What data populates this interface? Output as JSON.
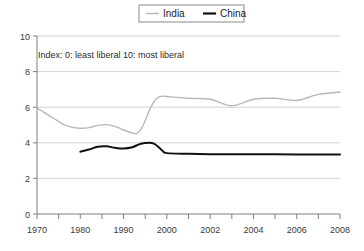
{
  "chart_data": {
    "type": "line",
    "title": "",
    "subtitle": "",
    "annotation": "Index: 0: least liberal 10: most liberal",
    "xlabel": "",
    "ylabel": "",
    "ylim": [
      0,
      10
    ],
    "yticks": [
      0,
      2,
      4,
      6,
      8,
      10
    ],
    "ytick_labels": [
      "0",
      "2",
      "4",
      "6",
      "8",
      "10"
    ],
    "grid": true,
    "grid_axis": "y",
    "xtick_labels": [
      "1970",
      "1980",
      "1990",
      "2000",
      "2002",
      "2004",
      "2006",
      "2008"
    ],
    "xtick_values": [
      1970,
      1980,
      1990,
      2000,
      2002,
      2004,
      2006,
      2008
    ],
    "x_axis_note": "non-linear: decade spacing 1970-2000, biennial 2000-2008",
    "legend": {
      "position": "top-center",
      "entries": [
        {
          "name": "India",
          "color": "#b9b9b9"
        },
        {
          "name": "China",
          "color": "#111111"
        }
      ]
    },
    "series": [
      {
        "name": "India",
        "color": "#b9b9b9",
        "width": 1.4,
        "points": [
          [
            1970,
            5.95
          ],
          [
            1972,
            5.65
          ],
          [
            1974,
            5.35
          ],
          [
            1976,
            5.05
          ],
          [
            1978,
            4.88
          ],
          [
            1980,
            4.82
          ],
          [
            1982,
            4.85
          ],
          [
            1984,
            4.98
          ],
          [
            1986,
            5.02
          ],
          [
            1988,
            4.92
          ],
          [
            1990,
            4.72
          ],
          [
            1992,
            4.55
          ],
          [
            1993,
            4.52
          ],
          [
            1994,
            4.75
          ],
          [
            1995,
            5.25
          ],
          [
            1996,
            5.85
          ],
          [
            1997,
            6.3
          ],
          [
            1998,
            6.55
          ],
          [
            1999,
            6.62
          ],
          [
            2000,
            6.6
          ],
          [
            2001,
            6.5
          ],
          [
            2002,
            6.45
          ],
          [
            2003,
            6.08
          ],
          [
            2004,
            6.45
          ],
          [
            2005,
            6.5
          ],
          [
            2006,
            6.38
          ],
          [
            2007,
            6.72
          ],
          [
            2008,
            6.85
          ]
        ]
      },
      {
        "name": "China",
        "color": "#111111",
        "width": 2.0,
        "points": [
          [
            1980,
            3.5
          ],
          [
            1982,
            3.62
          ],
          [
            1984,
            3.78
          ],
          [
            1986,
            3.8
          ],
          [
            1988,
            3.72
          ],
          [
            1990,
            3.68
          ],
          [
            1992,
            3.75
          ],
          [
            1994,
            3.95
          ],
          [
            1996,
            4.0
          ],
          [
            1997,
            3.95
          ],
          [
            1998,
            3.78
          ],
          [
            1999,
            3.55
          ],
          [
            2000,
            3.42
          ],
          [
            2001,
            3.38
          ],
          [
            2002,
            3.36
          ],
          [
            2003,
            3.35
          ],
          [
            2004,
            3.35
          ],
          [
            2005,
            3.35
          ],
          [
            2006,
            3.34
          ],
          [
            2007,
            3.34
          ],
          [
            2008,
            3.34
          ]
        ]
      }
    ]
  },
  "colors": {
    "india": "#b9b9b9",
    "china": "#111111",
    "grid": "#c8c8c8",
    "axis": "#808080",
    "text": "#2b2b2b",
    "legend_border": "#8a8a8a",
    "background": "#ffffff"
  }
}
